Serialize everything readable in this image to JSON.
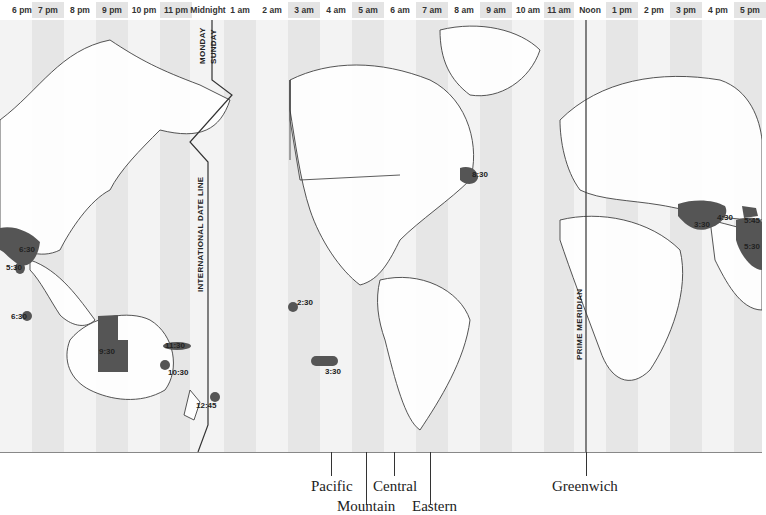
{
  "header": {
    "hours": [
      "6 pm",
      "7 pm",
      "8 pm",
      "9 pm",
      "10 pm",
      "11 pm",
      "Midnight",
      "1 am",
      "2 am",
      "3 am",
      "4 am",
      "5 am",
      "6 am",
      "7 am",
      "8 am",
      "9 am",
      "10 am",
      "11 am",
      "Noon",
      "1 pm",
      "2 pm",
      "3 pm",
      "4 pm",
      "5 pm"
    ]
  },
  "map": {
    "date_line": {
      "label": "INTERNATIONAL DATE LINE",
      "west_day": "MONDAY",
      "east_day": "SUNDAY"
    },
    "prime_meridian": {
      "label": "PRIME MERIDIAN"
    },
    "half_hour_zones": [
      {
        "id": "myanmar",
        "label": "6:30"
      },
      {
        "id": "india-west",
        "label": "5:30"
      },
      {
        "id": "cocos",
        "label": "6:30"
      },
      {
        "id": "australia-central",
        "label": "9:30"
      },
      {
        "id": "lord-howe",
        "label": "11:30"
      },
      {
        "id": "norfolk",
        "label": "10:30"
      },
      {
        "id": "chatham",
        "label": "12:45"
      },
      {
        "id": "marquesas",
        "label": "2:30"
      },
      {
        "id": "pitcairn",
        "label": "3:30"
      },
      {
        "id": "newfoundland",
        "label": "8:30"
      },
      {
        "id": "iran",
        "label": "3:30"
      },
      {
        "id": "afghanistan",
        "label": "4:30"
      },
      {
        "id": "nepal",
        "label": "5:45"
      },
      {
        "id": "india",
        "label": "5:30"
      }
    ],
    "colors": {
      "shade_stripe": "#e6e6e6",
      "light_stripe": "#f3f3f3",
      "zone_fill": "#555555",
      "coast": "#333333"
    }
  },
  "axis": {
    "labels": [
      {
        "id": "pacific",
        "text": "Pacific"
      },
      {
        "id": "mountain",
        "text": "Mountain"
      },
      {
        "id": "central",
        "text": "Central"
      },
      {
        "id": "eastern",
        "text": "Eastern"
      },
      {
        "id": "greenwich",
        "text": "Greenwich"
      }
    ]
  }
}
